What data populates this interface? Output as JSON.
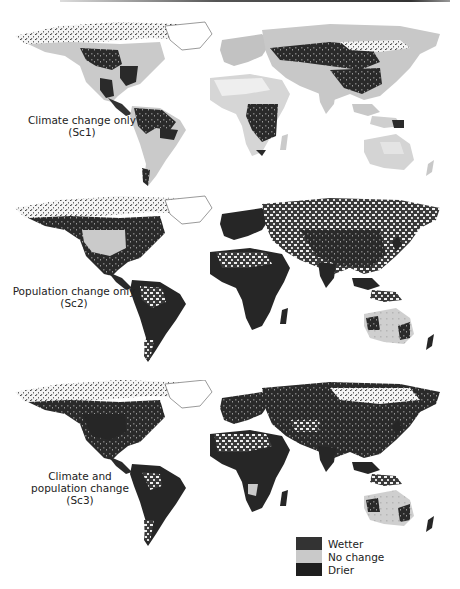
{
  "figure": {
    "panels": [
      {
        "id": "sc1",
        "label_line1": "Climate change only",
        "label_line2": "(Sc1)",
        "label_line3": ""
      },
      {
        "id": "sc2",
        "label_line1": "Population change only",
        "label_line2": "(Sc2)",
        "label_line3": ""
      },
      {
        "id": "sc3",
        "label_line1": "Climate and",
        "label_line2": "population change",
        "label_line3": "(Sc3)"
      }
    ],
    "legend": {
      "items": [
        {
          "label": "Wetter",
          "color": "#333333"
        },
        {
          "label": "No change",
          "color": "#c9c9c9"
        },
        {
          "label": "Drier",
          "color": "#1e1e1e"
        }
      ]
    }
  }
}
